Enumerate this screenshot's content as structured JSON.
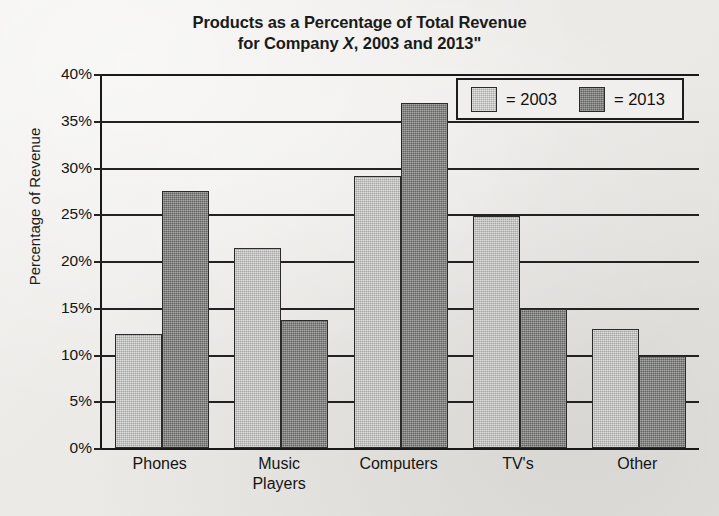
{
  "chart_data": {
    "type": "bar",
    "title": "Products as a Percentage of Total Revenue for Company X, 2003 and 2013\"",
    "title_line1": "Products as a Percentage of Total Revenue",
    "title_line2_before": "for Company ",
    "title_line2_italic": "X",
    "title_line2_after": ", 2003 and 2013\"",
    "xlabel": "",
    "ylabel": "Percentage of Revenue",
    "categories": [
      "Phones",
      "Music\nPlayers",
      "Computers",
      "TV's",
      "Other"
    ],
    "ylim": [
      0,
      40
    ],
    "ytick_labels": [
      "0%",
      "5%",
      "10%",
      "15%",
      "20%",
      "25%",
      "30%",
      "35%",
      "40%"
    ],
    "ytick_values": [
      0,
      5,
      10,
      15,
      20,
      25,
      30,
      35,
      40
    ],
    "grid": "horizontal",
    "legend_position": "top-right",
    "series": [
      {
        "name": "= 2003",
        "color": "#b9b9b7",
        "values": [
          12.2,
          21.4,
          29.1,
          24.8,
          12.7
        ]
      },
      {
        "name": "= 2013",
        "color": "#7f7f7d",
        "values": [
          27.5,
          13.7,
          36.9,
          14.9,
          9.8
        ]
      }
    ]
  },
  "legend": {
    "items": [
      {
        "label": "= 2003",
        "swatch": "light-gray"
      },
      {
        "label": "= 2013",
        "swatch": "dark-gray"
      }
    ]
  }
}
